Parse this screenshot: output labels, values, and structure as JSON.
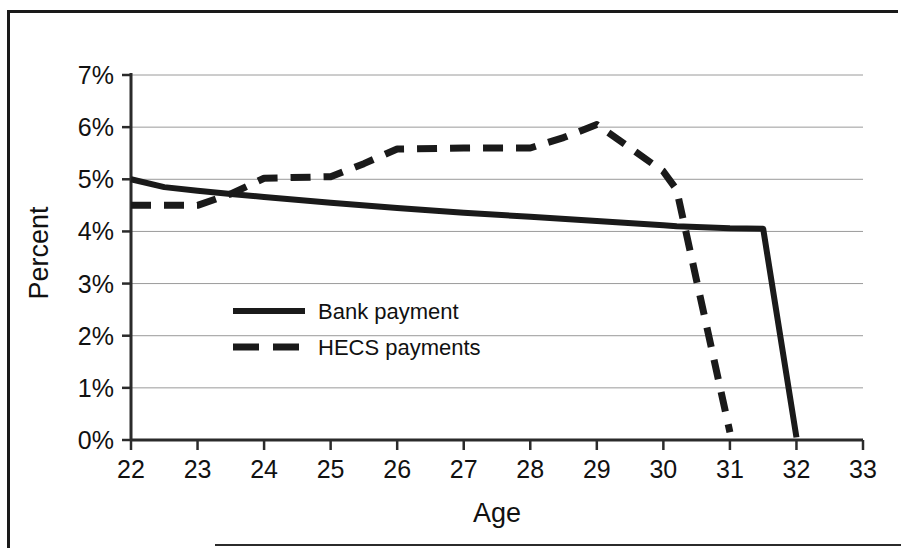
{
  "chart_data": {
    "type": "line",
    "title": "",
    "xlabel": "Age",
    "ylabel": "Percent",
    "xlim": [
      22,
      33
    ],
    "ylim": [
      0,
      7
    ],
    "xticks": [
      "22",
      "23",
      "24",
      "25",
      "26",
      "27",
      "28",
      "29",
      "30",
      "31",
      "32",
      "33"
    ],
    "yticks": [
      "0%",
      "1%",
      "2%",
      "3%",
      "4%",
      "5%",
      "6%",
      "7%"
    ],
    "grid": "horizontal",
    "legend_position": "center-left-inside",
    "series": [
      {
        "name": "Bank payment",
        "style": "solid",
        "color": "#1a1a1a",
        "x": [
          22,
          22.5,
          23,
          23.5,
          24,
          25,
          26,
          27,
          28,
          29,
          30,
          30.2,
          31,
          31.5,
          32
        ],
        "y": [
          5.0,
          4.85,
          4.78,
          4.72,
          4.66,
          4.55,
          4.45,
          4.36,
          4.28,
          4.2,
          4.12,
          4.1,
          4.06,
          4.05,
          0.05
        ]
      },
      {
        "name": "HECS payments",
        "style": "dashed",
        "color": "#1a1a1a",
        "x": [
          22,
          23,
          23.5,
          24,
          25,
          25.5,
          26,
          27,
          28,
          28.5,
          29,
          29.5,
          30,
          30.2,
          31
        ],
        "y": [
          4.5,
          4.5,
          4.72,
          5.02,
          5.05,
          5.3,
          5.58,
          5.6,
          5.6,
          5.8,
          6.05,
          5.6,
          5.15,
          4.8,
          0.15
        ]
      }
    ]
  },
  "legend": {
    "items": [
      {
        "label": "Bank payment",
        "style": "solid"
      },
      {
        "label": "HECS payments",
        "style": "dashed"
      }
    ]
  }
}
